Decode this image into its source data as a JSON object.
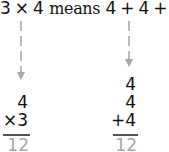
{
  "statement": {
    "left_factor": "3",
    "times_sign": "×",
    "right_factor": "4",
    "word": "means",
    "addend_1": "4",
    "plus_1": "+",
    "addend_2": "4",
    "plus_2": "+",
    "addend_3": "4"
  },
  "multiplication": {
    "top": "4",
    "bottom": "×3",
    "result": "12"
  },
  "addition": {
    "row_1": "4",
    "row_2": "4",
    "row_3": "+4",
    "result": "12"
  },
  "colors": {
    "text": "#111111",
    "arrow": "#b8b8b8",
    "result": "#a7a7a7",
    "rule": "#555555"
  }
}
